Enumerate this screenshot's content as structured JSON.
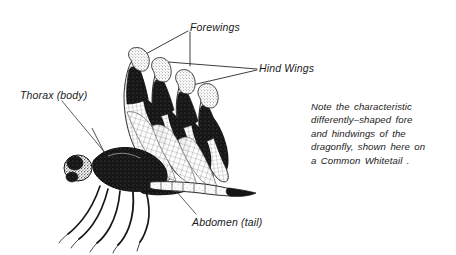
{
  "figure": {
    "background_color": "#ffffff",
    "ink_color": "#1a1a1a",
    "width": 456,
    "height": 255
  },
  "labels": {
    "forewings": "Forewings",
    "hind_wings": "Hind Wings",
    "thorax": "Thorax (body)",
    "abdomen": "Abdomen (tail)"
  },
  "note": {
    "lines": [
      "Note  the  characteristic",
      "differently–shaped  fore",
      "and  hindwings  of  the",
      "dragonfly,  shown  here  on",
      "a  Common  Whitetail ."
    ]
  },
  "illustration": {
    "parts": [
      "head",
      "thorax",
      "forewing-upper",
      "forewing-lower",
      "hindwing-upper",
      "hindwing-lower",
      "abdomen",
      "legs"
    ],
    "style": "pen-and-ink stipple engraving"
  }
}
